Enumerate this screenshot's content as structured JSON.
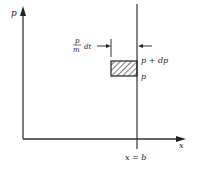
{
  "diagram": {
    "y_axis_label": "p",
    "x_axis_label": "x",
    "boundary_label": "x = b",
    "fraction_numerator": "p",
    "fraction_denominator": "m",
    "width_suffix": "dt",
    "upper_label": "p + dp",
    "lower_label": "p",
    "colors": {
      "ink": "#222222",
      "background": "#ffffff"
    }
  }
}
